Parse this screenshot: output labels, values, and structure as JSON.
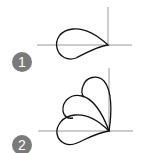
{
  "figures": [
    {
      "label": "1",
      "description": "Single teardrop loop attached at origin, pointing left",
      "petals": 1
    },
    {
      "label": "2",
      "description": "Three overlapping teardrop petals fanning from origin into upper-left quadrant",
      "petals": 3
    }
  ],
  "colors": {
    "axis": "#9a9a9a",
    "curve": "#111111",
    "badge": "#7a7a7a",
    "badge_text": "#ffffff"
  }
}
